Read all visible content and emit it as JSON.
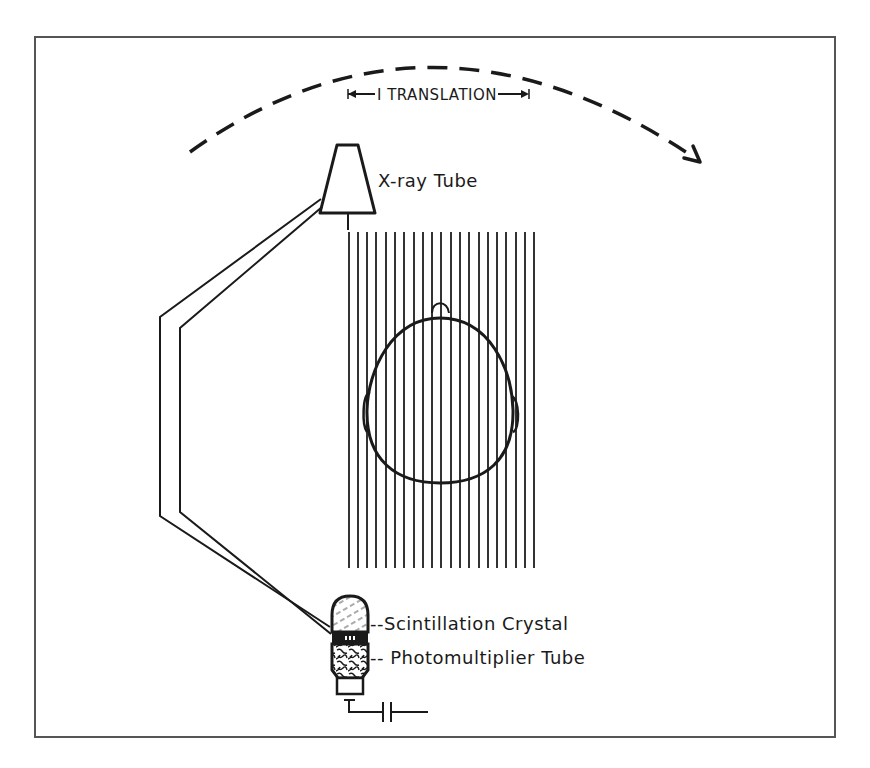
{
  "diagram": {
    "title_hint": "First-generation CT scanner: translate-rotate geometry",
    "labels": {
      "translation": "I TRANSLATION",
      "xray_tube": "X-ray Tube",
      "scintillation_crystal": "--Scintillation Crystal",
      "photomultiplier_tube": "-- Photomultiplier Tube"
    },
    "elements": {
      "rotation_arc": "dashed arc indicating rotation, arrow pointing clockwise",
      "translation_arrow": "double-headed horizontal arrow",
      "pencil_beams_count": 21,
      "head": "cross-section of patient head (top view) with nose and ears",
      "detector": "scintillation crystal above photomultiplier tube with capacitor output"
    },
    "colors": {
      "ink": "#1a1a1a",
      "frame": "#555555",
      "background": "#ffffff"
    }
  }
}
